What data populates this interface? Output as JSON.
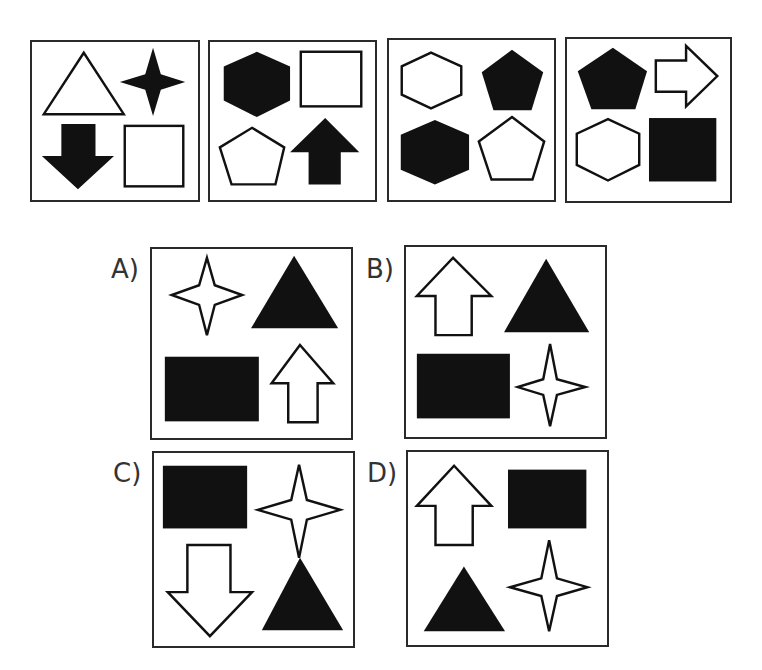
{
  "puzzle": {
    "sequence": [
      {
        "index": 1,
        "shapes": [
          {
            "pos": "top-left",
            "shape": "triangle",
            "fill": "white"
          },
          {
            "pos": "top-right",
            "shape": "four-point-star",
            "fill": "black"
          },
          {
            "pos": "bottom-left",
            "shape": "arrow-down",
            "fill": "black"
          },
          {
            "pos": "bottom-right",
            "shape": "square",
            "fill": "white"
          }
        ]
      },
      {
        "index": 2,
        "shapes": [
          {
            "pos": "top-left",
            "shape": "hexagon",
            "fill": "black"
          },
          {
            "pos": "top-right",
            "shape": "rectangle",
            "fill": "white"
          },
          {
            "pos": "bottom-left",
            "shape": "pentagon",
            "fill": "white"
          },
          {
            "pos": "bottom-right",
            "shape": "arrow-up",
            "fill": "black"
          }
        ]
      },
      {
        "index": 3,
        "shapes": [
          {
            "pos": "top-left",
            "shape": "hexagon",
            "fill": "white"
          },
          {
            "pos": "top-right",
            "shape": "pentagon",
            "fill": "black"
          },
          {
            "pos": "bottom-left",
            "shape": "hexagon",
            "fill": "black"
          },
          {
            "pos": "bottom-right",
            "shape": "pentagon",
            "fill": "white"
          }
        ]
      },
      {
        "index": 4,
        "shapes": [
          {
            "pos": "top-left",
            "shape": "pentagon",
            "fill": "black"
          },
          {
            "pos": "top-right",
            "shape": "arrow-right",
            "fill": "white"
          },
          {
            "pos": "bottom-left",
            "shape": "hexagon",
            "fill": "white"
          },
          {
            "pos": "bottom-right",
            "shape": "square",
            "fill": "black"
          }
        ]
      }
    ],
    "options": [
      {
        "label": "A)",
        "shapes": [
          {
            "pos": "top-left",
            "shape": "four-point-star",
            "fill": "white"
          },
          {
            "pos": "top-right",
            "shape": "triangle",
            "fill": "black"
          },
          {
            "pos": "bottom-left",
            "shape": "rectangle",
            "fill": "black"
          },
          {
            "pos": "bottom-right",
            "shape": "arrow-up",
            "fill": "white"
          }
        ]
      },
      {
        "label": "B)",
        "shapes": [
          {
            "pos": "top-left",
            "shape": "arrow-up",
            "fill": "white"
          },
          {
            "pos": "top-right",
            "shape": "triangle",
            "fill": "black"
          },
          {
            "pos": "bottom-left",
            "shape": "rectangle",
            "fill": "black"
          },
          {
            "pos": "bottom-right",
            "shape": "four-point-star",
            "fill": "white"
          }
        ]
      },
      {
        "label": "C)",
        "shapes": [
          {
            "pos": "top-left",
            "shape": "rectangle",
            "fill": "black"
          },
          {
            "pos": "top-right",
            "shape": "four-point-star",
            "fill": "white"
          },
          {
            "pos": "bottom-left",
            "shape": "arrow-down",
            "fill": "white"
          },
          {
            "pos": "bottom-right",
            "shape": "triangle",
            "fill": "black"
          }
        ]
      },
      {
        "label": "D)",
        "shapes": [
          {
            "pos": "top-left",
            "shape": "arrow-up",
            "fill": "white"
          },
          {
            "pos": "top-right",
            "shape": "rectangle",
            "fill": "black"
          },
          {
            "pos": "bottom-left",
            "shape": "triangle",
            "fill": "black"
          },
          {
            "pos": "bottom-right",
            "shape": "four-point-star",
            "fill": "white"
          }
        ]
      }
    ]
  },
  "colors": {
    "ink": "#111111",
    "border": "#2a2a2a",
    "background": "#ffffff"
  }
}
